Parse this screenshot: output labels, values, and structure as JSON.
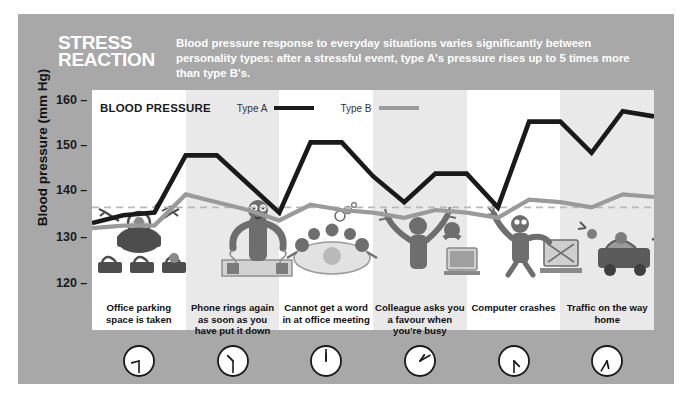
{
  "poster": {
    "title_line1": "STRESS",
    "title_line2": "REACTION",
    "subtitle": "Blood pressure response to everyday situations varies significantly between personality types: after a stressful event, type A's pressure rises up to 5 times more than type B's.",
    "background_color": "#a8a8a8",
    "panel_color": "#ffffff",
    "band_color": "#e9e9e9"
  },
  "legend": {
    "title": "BLOOD PRESSURE",
    "items": [
      {
        "label": "Type A",
        "color": "#1a1a1a"
      },
      {
        "label": "Type B",
        "color": "#9a9a9a"
      }
    ]
  },
  "axis": {
    "y_label": "Blood pressure (mm Hg)",
    "y_ticks": [
      "160",
      "150",
      "140",
      "130",
      "120"
    ],
    "y_values": [
      160,
      150,
      140,
      130,
      120
    ],
    "threshold": 140
  },
  "situations": [
    {
      "caption": "Office parking space is taken",
      "clock": "clock-icon-1",
      "hour": 8,
      "minute": 30,
      "illustration": "angry-driver-parking-lot"
    },
    {
      "caption": "Phone rings again as soon as you have put it down",
      "clock": "clock-icon-2",
      "hour": 10,
      "minute": 30,
      "illustration": "frustrated-person-at-desk-phone"
    },
    {
      "caption": "Cannot get a word in at office meeting",
      "clock": "clock-icon-3",
      "hour": 12,
      "minute": 0,
      "illustration": "meeting-table-people-talking"
    },
    {
      "caption": "Colleague asks you a favour when you're busy",
      "clock": "clock-icon-4",
      "hour": 1,
      "minute": 10,
      "illustration": "colleague-interrupting-at-computer"
    },
    {
      "caption": "Computer crashes",
      "clock": "clock-icon-5",
      "hour": 4,
      "minute": 30,
      "illustration": "person-angry-at-computer"
    },
    {
      "caption": "Traffic on the way home",
      "clock": "clock-icon-6",
      "hour": 5,
      "minute": 35,
      "illustration": "car-traffic-jam-horns"
    }
  ],
  "chart_data": {
    "type": "line",
    "title": "BLOOD PRESSURE",
    "xlabel": "",
    "ylabel": "Blood pressure (mm Hg)",
    "ylim": [
      117,
      162
    ],
    "grid": false,
    "legend_position": "top",
    "threshold_line": 140,
    "x": [
      0,
      1,
      2,
      3,
      4,
      5,
      6,
      7,
      8,
      9,
      10,
      11,
      12,
      13,
      14,
      15,
      16,
      17,
      18
    ],
    "series": [
      {
        "name": "Type A",
        "color": "#1a1a1a",
        "values": [
          137,
          138.5,
          139,
          150,
          150,
          144.5,
          139,
          152.5,
          152.5,
          146,
          141,
          146.5,
          146.5,
          140,
          156.5,
          156.5,
          150.5,
          158.5,
          157.5
        ]
      },
      {
        "name": "Type B",
        "color": "#9a9a9a",
        "values": [
          136,
          136.5,
          136.5,
          142.5,
          141,
          139.5,
          137.5,
          140.5,
          139.5,
          139,
          138,
          139.5,
          139,
          138,
          141.5,
          141,
          140,
          142.5,
          142
        ]
      }
    ]
  }
}
